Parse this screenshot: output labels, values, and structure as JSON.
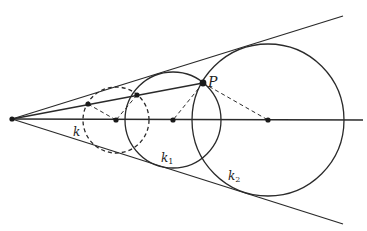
{
  "diagram": {
    "type": "geometry",
    "colors": {
      "stroke": "#2a2a2a",
      "background": "#ffffff"
    },
    "vertex": {
      "x": 12,
      "y": 119
    },
    "upper_ray_end": {
      "x": 343,
      "y": 16
    },
    "lower_ray_end": {
      "x": 343,
      "y": 224
    },
    "bisector_end": {
      "x": 363,
      "y": 120
    },
    "secant_end": {
      "x": 203,
      "y": 83
    },
    "circles": [
      {
        "name": "k",
        "cx": 116,
        "cy": 120,
        "r": 33,
        "style": "dashed"
      },
      {
        "name": "k1",
        "cx": 173,
        "cy": 120,
        "r": 48,
        "style": "solid"
      },
      {
        "name": "k2",
        "cx": 268,
        "cy": 120,
        "r": 76,
        "style": "solid"
      }
    ],
    "points": [
      {
        "name": "vertex",
        "x": 12,
        "y": 119
      },
      {
        "name": "P",
        "x": 203,
        "y": 83
      },
      {
        "name": "A",
        "x": 88,
        "y": 104
      },
      {
        "name": "B",
        "x": 137,
        "y": 95
      },
      {
        "name": "center-k",
        "x": 116,
        "y": 120
      },
      {
        "name": "center-k1",
        "x": 173,
        "y": 120
      },
      {
        "name": "center-k2",
        "x": 268,
        "y": 120
      }
    ],
    "dashed_segments": [
      {
        "from": [
          88,
          104
        ],
        "to": [
          116,
          120
        ]
      },
      {
        "from": [
          137,
          95
        ],
        "to": [
          116,
          120
        ]
      },
      {
        "from": [
          203,
          83
        ],
        "to": [
          173,
          120
        ]
      },
      {
        "from": [
          203,
          83
        ],
        "to": [
          268,
          120
        ]
      }
    ],
    "labels": {
      "P": "P",
      "k": "k",
      "k1_base": "k",
      "k1_sub": "1",
      "k2_base": "k",
      "k2_sub": "2"
    }
  }
}
